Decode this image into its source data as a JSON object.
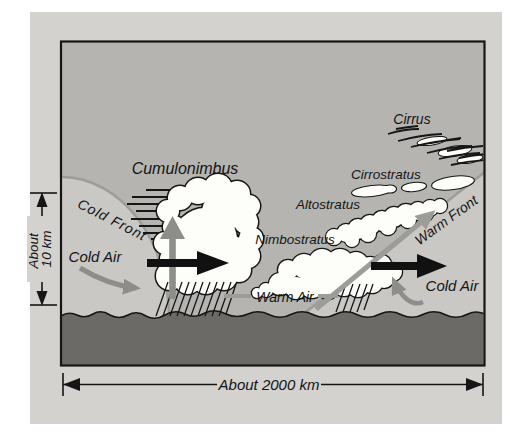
{
  "diagram": {
    "labels": {
      "cumulonimbus": "Cumulonimbus",
      "cold_front": "Cold Front",
      "cold_air_left": "Cold Air",
      "warm_air": "Warm Air",
      "nimbostratus": "Nimbostratus",
      "altostratus": "Altostratus",
      "cirrostratus": "Cirrostratus",
      "cirrus": "Cirrus",
      "warm_front": "Warm Front",
      "cold_air_right": "Cold Air"
    },
    "scales": {
      "vertical_line1": "About",
      "vertical_line2": "10 km",
      "horizontal": "About 2000 km"
    },
    "arrows": {
      "cold_air_inflow": "gray-curved-arrow-down-right",
      "cold_front_push": "black-thick-arrow-right",
      "cumulonimbus_updraft": "gray-arrow-up",
      "warm_air_ascent": "gray-long-arrow-up-right",
      "warm_front_push": "black-thick-arrow-right",
      "cold_air_retreat_hook": "gray-hook-arrow-up-left"
    },
    "colors": {
      "page_background": "#ffffff",
      "figure_background": "#d3d2cf",
      "sky": "#b5b4b1",
      "cold_air_region": "#c9c8c5",
      "ground": "#6b6a67",
      "cloud_fill": "#fdfdfa",
      "outline": "#161616",
      "gray_arrow": "#8d8d8a",
      "front_line": "#9c9c99",
      "text": "#141414"
    }
  }
}
